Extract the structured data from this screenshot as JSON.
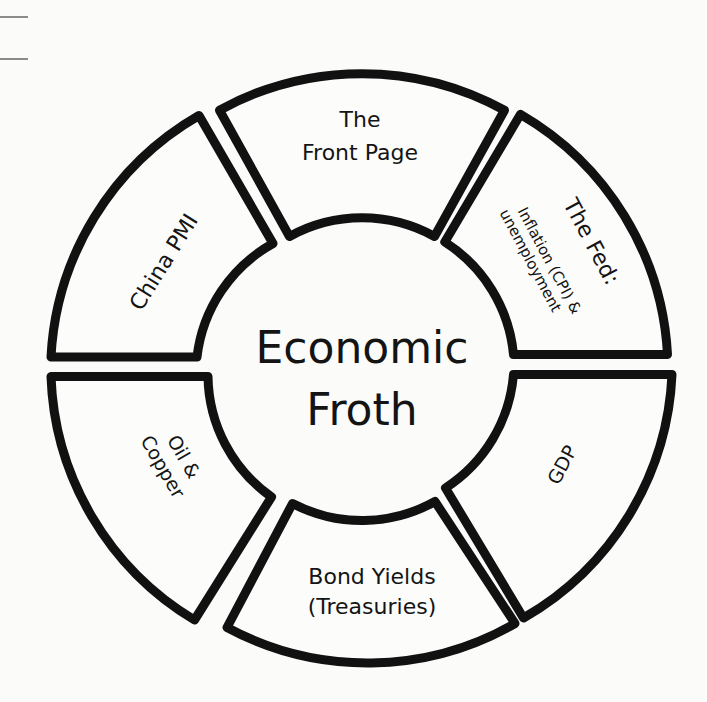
{
  "diagram": {
    "center": {
      "line1": "Economic",
      "line2": "Froth"
    },
    "segments": [
      {
        "id": "front-page",
        "lines": [
          "The",
          "Front Page"
        ]
      },
      {
        "id": "the-fed",
        "lines": [
          "The Fed:",
          "Inflation (CPI) &",
          "unemployment"
        ]
      },
      {
        "id": "gdp",
        "lines": [
          "GDP"
        ]
      },
      {
        "id": "bond-yields",
        "lines": [
          "Bond Yields",
          "(Treasuries)"
        ]
      },
      {
        "id": "oil-copper",
        "lines": [
          "Oil &",
          "Copper"
        ]
      },
      {
        "id": "china-pmi",
        "lines": [
          "China PMI"
        ]
      }
    ],
    "colors": {
      "stroke": "#111111",
      "background": "#fbfbfa",
      "text": "#141414"
    }
  }
}
